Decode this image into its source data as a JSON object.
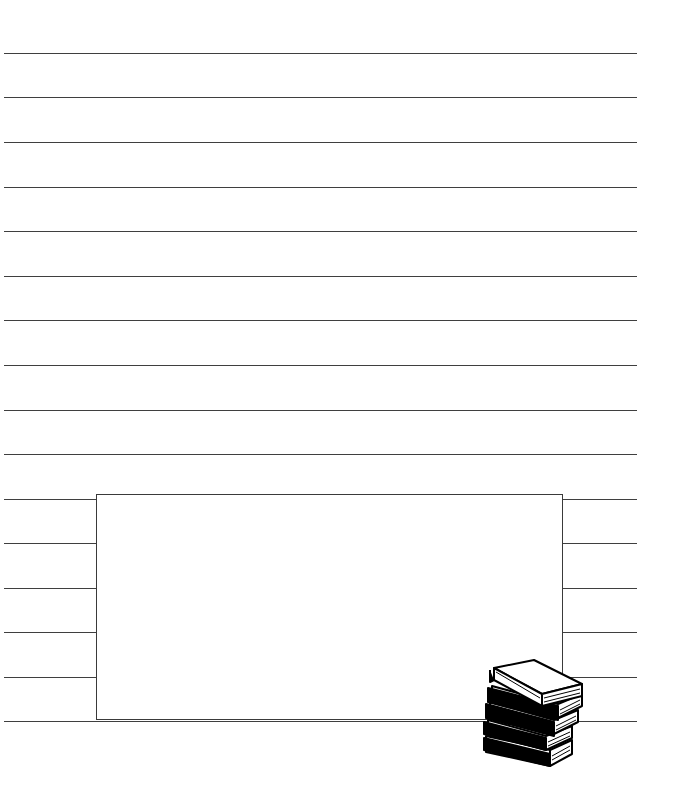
{
  "page": {
    "type": "lined-writing-paper",
    "background": "#ffffff",
    "line_color": "#3f3f3f",
    "full_width_lines_y": [
      53,
      97,
      142,
      187,
      231,
      276,
      320,
      365,
      410,
      454
    ],
    "split_lines_y": [
      499,
      543,
      588,
      632,
      677
    ],
    "bottom_line_y": 721
  },
  "text_box": {
    "content": ""
  },
  "decoration": {
    "icon": "stack-of-books-icon"
  }
}
